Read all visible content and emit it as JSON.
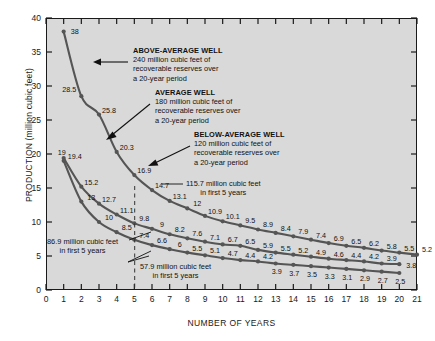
{
  "chart_data": {
    "type": "line",
    "title": "",
    "xlabel": "NUMBER OF YEARS",
    "ylabel": "PRODUCTION (million cubic feet)",
    "xlim": [
      0,
      21
    ],
    "ylim": [
      0,
      40
    ],
    "xticks": [
      "0",
      "1",
      "2",
      "3",
      "4",
      "5",
      "6",
      "7",
      "8",
      "9",
      "10",
      "11",
      "12",
      "13",
      "14",
      "15",
      "16",
      "17",
      "18",
      "19",
      "20",
      "21"
    ],
    "yticks": [
      "0",
      "5",
      "10",
      "15",
      "20",
      "25",
      "30",
      "35",
      "40"
    ],
    "grid": false,
    "legend": "none",
    "x": [
      1,
      2,
      3,
      4,
      5,
      6,
      7,
      8,
      9,
      10,
      11,
      12,
      13,
      14,
      15,
      16,
      17,
      18,
      19,
      20
    ],
    "series": [
      {
        "name": "ABOVE-AVERAGE WELL",
        "values": [
          38,
          28.5,
          25.8,
          20.3,
          16.9,
          14.7,
          13.1,
          12,
          10.9,
          10.1,
          9.5,
          8.9,
          8.4,
          7.9,
          7.4,
          6.9,
          6.5,
          6.2,
          5.8,
          5.5
        ],
        "extra_point": {
          "x": 21,
          "y": 5.2,
          "label": "5.2"
        }
      },
      {
        "name": "AVERAGE WELL",
        "values": [
          19.4,
          15.2,
          12.7,
          11.1,
          9.8,
          9,
          8.2,
          7.6,
          7.1,
          6.7,
          6.5,
          5.9,
          5.5,
          5.2,
          4.9,
          4.6,
          4.4,
          4.2,
          3.9,
          3.8
        ],
        "extra_point": null
      },
      {
        "name": "BELOW-AVERAGE WELL",
        "values": [
          19,
          13,
          10,
          8.5,
          7.4,
          6.6,
          6,
          5.5,
          5.1,
          4.7,
          4.4,
          4.2,
          3.9,
          3.7,
          3.5,
          3.3,
          3.1,
          2.9,
          2.7,
          2.5
        ],
        "extra_point": null
      }
    ],
    "annotations": [
      {
        "id": "above-average",
        "heading": "ABOVE-AVERAGE WELL",
        "line1": "240 million cubic feet of",
        "line2": "recoverable reserves over",
        "line3": "a 20-year period"
      },
      {
        "id": "average",
        "heading": "AVERAGE WELL",
        "line1": "180 million cubic feet of",
        "line2": "recoverable reserves over",
        "line3": "a 20-year period"
      },
      {
        "id": "below-average",
        "heading": "BELOW-AVERAGE WELL",
        "line1": "120 million cubic feet of",
        "line2": "recoverable reserves over",
        "line3": "a 20-year period"
      }
    ],
    "callouts": [
      {
        "id": "first5-above",
        "line1": "115.7 million cubic feet",
        "line2": "in first 5 years"
      },
      {
        "id": "first5-average",
        "line1": "86.9 million cubic feet",
        "line2": "in first 5 years"
      },
      {
        "id": "first5-below",
        "line1": "57.9 million cubic feet",
        "line2": "in first 5 years"
      }
    ],
    "colors": {
      "plot_background": "#d9d9d9",
      "page_background": "#ffffff",
      "curve": "#555555",
      "axis": "#1a1a1a",
      "text": "#111111"
    }
  }
}
